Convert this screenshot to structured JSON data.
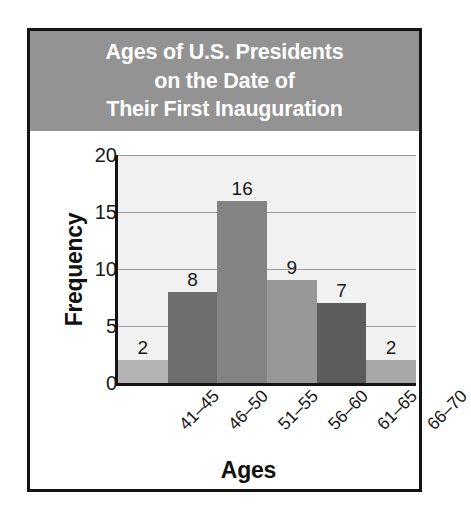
{
  "figure": {
    "banner_color": "#939393",
    "banner_text_color": "#ffffff",
    "frame_color": "#151515",
    "plot_background": "#f1f1f1",
    "title_lines": [
      "Ages of U.S. Presidents",
      "on the Date of",
      "Their First Inauguration"
    ]
  },
  "chart_data": {
    "type": "bar",
    "title": "Ages of U.S. Presidents on the Date of Their First Inauguration",
    "xlabel": "Ages",
    "ylabel": "Frequency",
    "categories": [
      "41–45",
      "46–50",
      "51–55",
      "56–60",
      "61–65",
      "66–70"
    ],
    "values": [
      2,
      8,
      16,
      9,
      7,
      2
    ],
    "data_labels": [
      "2",
      "8",
      "16",
      "9",
      "7",
      "2"
    ],
    "bar_colors": [
      "#b4b4b4",
      "#6e6e6e",
      "#838383",
      "#979797",
      "#5c5c5c",
      "#a8a8a8"
    ],
    "ylim": [
      0,
      20
    ],
    "yticks": [
      0,
      5,
      10,
      15,
      20
    ],
    "ytick_labels": [
      "0",
      "5",
      "10",
      "15",
      "20"
    ],
    "gridlines": [
      5,
      10,
      15,
      20
    ],
    "grid": true,
    "legend": null,
    "xtick_rotation": -45
  }
}
